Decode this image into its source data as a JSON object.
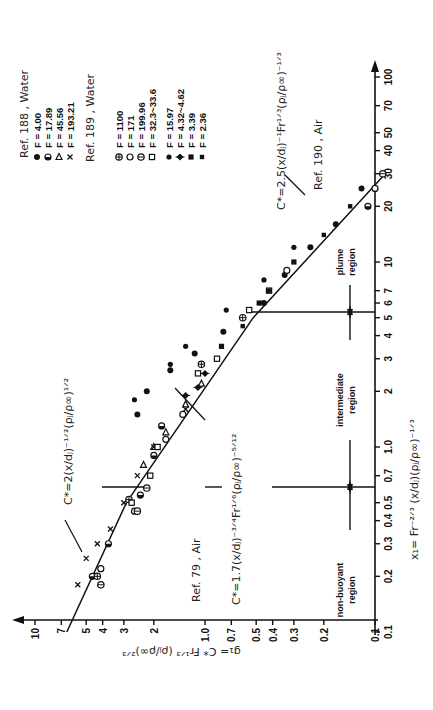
{
  "chart_data": {
    "type": "scatter",
    "orientation": "rotated-90-clockwise",
    "title": "",
    "xlabel": "x1 = Fr^-2/3 (x/dj)(ρj/ρ∞)^-1/3",
    "ylabel": "g1 = C* Fr^1/3 (ρj/ρ∞)^2/3",
    "xscale": "log",
    "yscale": "log",
    "xlim": [
      0.1,
      100
    ],
    "ylim": [
      0.1,
      10
    ],
    "x_ticks": [
      "0.1",
      "0.2",
      "0.3",
      "0.4",
      "0.5",
      "0.7",
      "1.0",
      "2",
      "3",
      "4",
      "5",
      "6",
      "7",
      "10",
      "20",
      "30",
      "40",
      "50",
      "70",
      "100"
    ],
    "x_tick_values": [
      0.1,
      0.2,
      0.3,
      0.4,
      0.5,
      0.7,
      1.0,
      2,
      3,
      4,
      5,
      6,
      7,
      10,
      20,
      30,
      40,
      50,
      70,
      100
    ],
    "y_ticks": [
      "0.1",
      "0.2",
      "0.3",
      "0.4",
      "0.5",
      "0.7",
      "1.0",
      "2",
      "3",
      "4",
      "5",
      "7",
      "10"
    ],
    "y_tick_values": [
      0.1,
      0.2,
      0.3,
      0.4,
      0.5,
      0.7,
      1.0,
      2,
      3,
      4,
      5,
      7,
      10
    ],
    "grid": false,
    "legend_position": "top-left (rotated)",
    "legend": [
      {
        "group": "Ref. 188 , Water",
        "entries": [
          {
            "marker": "filled-circle",
            "label": "F = 4.00"
          },
          {
            "marker": "half-circle",
            "label": "F = 17.89"
          },
          {
            "marker": "triangle",
            "label": "F = 45.56"
          },
          {
            "marker": "cross",
            "label": "F = 193.21"
          }
        ]
      },
      {
        "group": "Ref. 189 , Water",
        "entries": [
          {
            "marker": "circle-plus",
            "label": "F = 1100"
          },
          {
            "marker": "open-circle",
            "label": "F = 171"
          },
          {
            "marker": "circle-minus",
            "label": "F = 199.96"
          },
          {
            "marker": "open-square",
            "label": "F = 32.3~33.6"
          }
        ]
      },
      {
        "group": "Ref. 79 , Air",
        "entries": [
          {
            "marker": "filled-dot",
            "label": "F = 15.97"
          },
          {
            "marker": "diamond-plus",
            "label": "F = 4.32~4.62"
          },
          {
            "marker": "filled-square",
            "label": "F = 3.39"
          },
          {
            "marker": "filled-square-small",
            "label": "F = 2.36"
          }
        ]
      },
      {
        "group": "Ref. 190 , Air",
        "entries": []
      }
    ],
    "lines": [
      {
        "name": "non-buoyant",
        "formula": "C*=2(x/dj)^-1/2 (ρj/ρ∞)^1/2",
        "slope": -0.5,
        "x": [
          0.1,
          0.5
        ],
        "y": [
          6.5,
          2.9
        ]
      },
      {
        "name": "intermediate",
        "formula": "C*=1.7(x/dj)^-3/4 Fr^1/6 (ρj/ρ∞)^-5/12",
        "slope": -0.75,
        "x": [
          0.5,
          5
        ],
        "y": [
          2.9,
          0.52
        ]
      },
      {
        "name": "plume",
        "formula": "C*=2.5(x/dj)^-1 Fr^1/3 (ρj/ρ∞)^-1/3",
        "slope": -1.0,
        "x": [
          5,
          30
        ],
        "y": [
          0.52,
          0.087
        ]
      }
    ],
    "regions": [
      {
        "label": "non-buoyant region",
        "x_range": [
          0.1,
          0.5
        ]
      },
      {
        "label": "intermediate region",
        "x_range": [
          0.5,
          5
        ]
      },
      {
        "label": "plume region",
        "x_range": [
          5,
          100
        ]
      }
    ],
    "series": [
      {
        "name": "Ref. 188 F=4.00",
        "marker": "filled-circle",
        "points": [
          [
            1.5,
            2.5
          ],
          [
            2.0,
            2.2
          ],
          [
            2.6,
            1.6
          ],
          [
            3.2,
            1.15
          ],
          [
            4.2,
            0.78
          ],
          [
            6.0,
            0.45
          ],
          [
            8.5,
            0.34
          ],
          [
            12,
            0.24
          ],
          [
            16,
            0.17
          ],
          [
            25,
            0.12
          ]
        ]
      },
      {
        "name": "Ref. 188 F=17.89",
        "marker": "half-circle",
        "points": [
          [
            0.2,
            4.6
          ],
          [
            0.3,
            3.7
          ],
          [
            0.55,
            2.4
          ],
          [
            0.9,
            2.0
          ],
          [
            1.3,
            1.8
          ],
          [
            20,
            0.11
          ]
        ]
      },
      {
        "name": "Ref. 188 F=45.56",
        "marker": "triangle",
        "points": [
          [
            0.8,
            2.3
          ],
          [
            1.0,
            2.0
          ],
          [
            1.2,
            1.7
          ],
          [
            1.7,
            1.3
          ],
          [
            2.2,
            1.05
          ]
        ]
      },
      {
        "name": "Ref. 188 F=193.21",
        "marker": "cross",
        "points": [
          [
            0.18,
            5.6
          ],
          [
            0.25,
            5.0
          ],
          [
            0.3,
            4.3
          ],
          [
            0.36,
            3.6
          ],
          [
            0.5,
            3.0
          ],
          [
            0.7,
            2.5
          ],
          [
            1.0,
            2.0
          ],
          [
            1.6,
            1.3
          ]
        ]
      },
      {
        "name": "Ref. 189 F=1100",
        "marker": "circle-plus",
        "points": [
          [
            0.2,
            4.3
          ],
          [
            0.52,
            2.8
          ],
          [
            2.8,
            1.05
          ],
          [
            5.0,
            0.6
          ]
        ]
      },
      {
        "name": "Ref. 189 F=171",
        "marker": "open-circle",
        "points": [
          [
            0.22,
            4.1
          ],
          [
            0.45,
            2.6
          ],
          [
            1.1,
            1.7
          ],
          [
            1.5,
            1.35
          ],
          [
            9,
            0.33
          ],
          [
            25,
            0.1
          ]
        ]
      },
      {
        "name": "Ref. 189 F=199.96",
        "marker": "circle-minus",
        "points": [
          [
            0.18,
            4.1
          ],
          [
            0.45,
            2.5
          ],
          [
            0.6,
            2.2
          ],
          [
            30,
            0.09
          ]
        ]
      },
      {
        "name": "Ref. 189 F=32.3~33.6",
        "marker": "open-square",
        "points": [
          [
            0.5,
            2.7
          ],
          [
            0.7,
            2.1
          ],
          [
            1.0,
            1.9
          ],
          [
            2.5,
            1.1
          ],
          [
            3.0,
            0.85
          ],
          [
            5.5,
            0.55
          ],
          [
            7,
            0.42
          ]
        ]
      },
      {
        "name": "Ref. 79 F=15.97",
        "marker": "filled-dot",
        "points": [
          [
            1.8,
            2.6
          ],
          [
            2.8,
            1.6
          ],
          [
            3.5,
            1.3
          ],
          [
            5.5,
            0.75
          ],
          [
            8,
            0.45
          ],
          [
            12,
            0.3
          ]
        ]
      },
      {
        "name": "Ref. 79 F=4.32~4.62",
        "marker": "diamond-plus",
        "points": [
          [
            1.9,
            1.3
          ],
          [
            2.1,
            1.1
          ],
          [
            2.5,
            1.0
          ]
        ]
      },
      {
        "name": "Ref. 79 F=3.39",
        "marker": "filled-square",
        "points": [
          [
            3.5,
            0.8
          ],
          [
            6,
            0.48
          ],
          [
            10,
            0.3
          ]
        ]
      },
      {
        "name": "Ref. 79 F=2.36",
        "marker": "filled-square-small",
        "points": [
          [
            4.5,
            0.6
          ],
          [
            7,
            0.42
          ],
          [
            14,
            0.2
          ],
          [
            20,
            0.14
          ]
        ]
      }
    ],
    "annotations": [
      "C*=2(x/dj)^-1/2 (ρj/ρ∞)^1/2",
      "C*=1.7(x/dj)^-3/4 Fr^1/6 (ρj/ρ∞)^-5/12",
      "C*=2.5(x/dj)^-1 Fr^1/3 (ρj/ρ∞)^-1/3",
      "Ref. 79 , Air",
      "Ref. 190 , Air",
      "non-buoyant region",
      "intermediate region",
      "plume region"
    ]
  },
  "texts": {
    "ref188": "Ref. 188 , Water",
    "ref189": "Ref. 189 , Water",
    "ref79": "Ref. 79 , Air",
    "ref190": "Ref. 190 , Air",
    "leg188_1": "F = 4.00",
    "leg188_2": "F = 17.89",
    "leg188_3": "F = 45.56",
    "leg188_4": "F = 193.21",
    "leg189_1": "F = 1100",
    "leg189_2": "F = 171",
    "leg189_3": "F = 199.96",
    "leg189_4": "F = 32.3~33.6",
    "leg79_1": "F = 15.97",
    "leg79_2": "F = 4.32~4.62",
    "leg79_3": "F = 3.39",
    "leg79_4": "F = 2.36",
    "eq_nb": "C*=2(x/dⱼ)⁻¹ᐟ²(ρⱼ/ρ∞)¹ᐟ²",
    "eq_int": "C*=1.7(x/dⱼ)⁻³ᐟ⁴Fr¹ᐟ⁶(ρⱼ/ρ∞)⁻⁵ᐟ¹²",
    "eq_pl": "C*=2.5(x/dⱼ)⁻¹Fr¹ᐟ³(ρⱼ/ρ∞)⁻¹ᐟ³",
    "xlabel": "x₁= Fr⁻²ᐟ³ (x/dⱼ)(ρⱼ/ρ∞)⁻¹ᐟ³",
    "ylabel": "g₁= C* Fr¹ᐟ³ (ρⱼ/ρ∞)²ᐟ³",
    "region_nb_1": "non-buoyant",
    "region_nb_2": "region",
    "region_int_1": "intermediate",
    "region_int_2": "region",
    "region_pl_1": "plume",
    "region_pl_2": "region"
  }
}
